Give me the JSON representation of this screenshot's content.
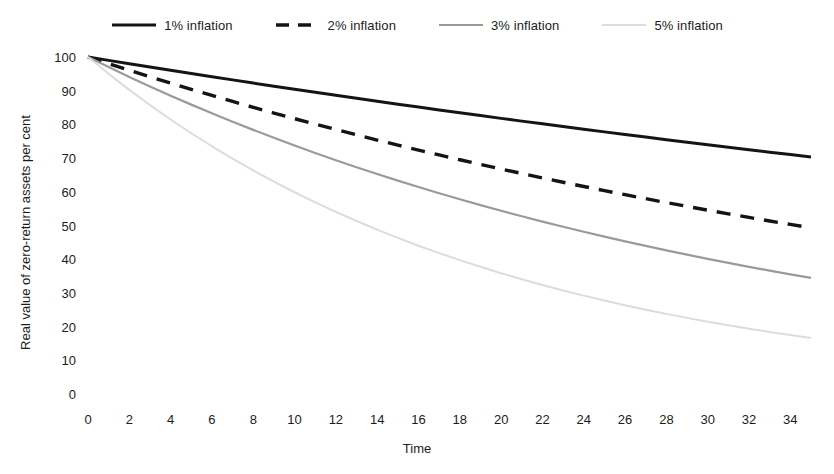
{
  "chart_data": {
    "type": "line",
    "title": "",
    "xlabel": "Time",
    "ylabel": "Real value of zero-return assets per cent",
    "xlim": [
      0,
      35
    ],
    "ylim": [
      0,
      100
    ],
    "grid": false,
    "legend_position": "top-center",
    "xticks": [
      "0",
      "2",
      "4",
      "6",
      "8",
      "10",
      "12",
      "14",
      "16",
      "18",
      "20",
      "22",
      "24",
      "26",
      "28",
      "30",
      "32",
      "34"
    ],
    "yticks": [
      "0",
      "10",
      "20",
      "30",
      "40",
      "50",
      "60",
      "70",
      "80",
      "90",
      "100"
    ],
    "x": [
      0,
      1,
      2,
      3,
      4,
      5,
      6,
      7,
      8,
      9,
      10,
      11,
      12,
      13,
      14,
      15,
      16,
      17,
      18,
      19,
      20,
      21,
      22,
      23,
      24,
      25,
      26,
      27,
      28,
      29,
      30,
      31,
      32,
      33,
      34,
      35
    ],
    "series": [
      {
        "name": "1% inflation",
        "rate": 0.01,
        "color": "#141414",
        "style": "solid",
        "width": 3.0,
        "values": [
          100,
          99,
          98,
          97.03,
          96.06,
          95.1,
          94.15,
          93.21,
          92.27,
          91.35,
          90.44,
          89.53,
          88.64,
          87.75,
          86.87,
          86.01,
          85.15,
          84.29,
          83.45,
          82.62,
          81.79,
          80.97,
          80.16,
          79.36,
          78.57,
          77.78,
          77.01,
          76.24,
          75.47,
          74.72,
          73.97,
          73.23,
          72.5,
          71.77,
          71.06,
          70.34
        ]
      },
      {
        "name": "2% inflation",
        "rate": 0.02,
        "color": "#141414",
        "style": "dashed",
        "width": 3.4,
        "values": [
          100,
          98,
          96.04,
          94.12,
          92.24,
          90.39,
          88.58,
          86.81,
          85.07,
          83.37,
          81.71,
          80.07,
          78.47,
          76.9,
          75.36,
          73.86,
          72.38,
          70.93,
          69.51,
          68.12,
          66.76,
          65.43,
          64.12,
          62.84,
          61.58,
          60.35,
          59.14,
          57.96,
          56.8,
          55.67,
          54.55,
          53.46,
          52.39,
          51.34,
          50.32,
          49.31
        ]
      },
      {
        "name": "3% inflation",
        "rate": 0.03,
        "color": "#9a9a9a",
        "style": "solid",
        "width": 2.2,
        "values": [
          100,
          97,
          94.09,
          91.27,
          88.53,
          85.87,
          83.3,
          80.8,
          78.37,
          76.02,
          73.74,
          71.53,
          69.38,
          67.3,
          65.28,
          63.33,
          61.43,
          59.58,
          57.8,
          56.06,
          54.38,
          52.75,
          51.17,
          49.64,
          48.15,
          46.7,
          45.3,
          43.94,
          42.62,
          41.34,
          40.1,
          38.9,
          37.73,
          36.6,
          35.5,
          34.44
        ]
      },
      {
        "name": "5% inflation",
        "rate": 0.05,
        "color": "#dcdcdc",
        "style": "solid",
        "width": 2.0,
        "values": [
          100,
          95,
          90.25,
          85.74,
          81.45,
          77.38,
          73.51,
          69.83,
          66.34,
          63.02,
          59.87,
          56.88,
          54.04,
          51.33,
          48.77,
          46.33,
          44.01,
          41.81,
          39.72,
          37.74,
          35.85,
          34.06,
          32.35,
          30.73,
          29.19,
          27.74,
          26.35,
          25.03,
          23.78,
          22.59,
          21.46,
          20.39,
          19.37,
          18.4,
          17.48,
          16.6
        ]
      }
    ]
  },
  "legend": {
    "entries": [
      {
        "label": "1% inflation"
      },
      {
        "label": "2% inflation"
      },
      {
        "label": "3% inflation"
      },
      {
        "label": "5% inflation"
      }
    ]
  },
  "axes": {
    "x_title": "Time",
    "y_title": "Real value of zero-return assets per cent"
  }
}
